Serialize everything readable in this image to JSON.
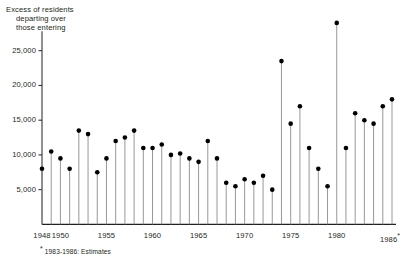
{
  "title": {
    "line1": "Excess of residents",
    "line2": "departing over",
    "line3": "those entering"
  },
  "footnote": {
    "marker": "*",
    "text": "1983-1986: Estimates"
  },
  "axis": {
    "y_ticks": [
      "5,000",
      "10,000",
      "15,000",
      "20,000",
      "25,000"
    ],
    "x_ticks": [
      "1948",
      "1950",
      "1955",
      "1960",
      "1965",
      "1970",
      "1975",
      "1980",
      "1986"
    ]
  },
  "colors": {
    "axis": "#231f20",
    "marker": "#000000",
    "stem": "#8c8c8c",
    "text": "#231f20",
    "background": "#ffffff"
  },
  "chart_data": {
    "type": "line",
    "title": "Excess of residents departing over those entering",
    "subtitle": "",
    "xlabel": "",
    "ylabel": "",
    "xlim": [
      1947.4,
      1986.6
    ],
    "ylim": [
      0,
      30000
    ],
    "grid": false,
    "legend": null,
    "marker_style": "filled-circle-with-stem",
    "x": [
      1948,
      1949,
      1950,
      1951,
      1952,
      1953,
      1954,
      1955,
      1956,
      1957,
      1958,
      1959,
      1960,
      1961,
      1962,
      1963,
      1964,
      1965,
      1966,
      1967,
      1968,
      1969,
      1970,
      1971,
      1972,
      1973,
      1974,
      1975,
      1976,
      1977,
      1978,
      1979,
      1980,
      1981,
      1982,
      1983,
      1984,
      1985,
      1986
    ],
    "values": [
      8000,
      10500,
      9500,
      8000,
      13500,
      13000,
      7500,
      9500,
      12000,
      12500,
      13500,
      11000,
      11000,
      11500,
      10000,
      10200,
      9500,
      9000,
      12000,
      9500,
      6000,
      5500,
      6500,
      6000,
      7000,
      5000,
      23500,
      14500,
      17000,
      11000,
      8000,
      5500,
      29000,
      11000,
      16000,
      15000,
      14500,
      17000,
      18000
    ],
    "y_ticks": [
      5000,
      10000,
      15000,
      20000,
      25000
    ],
    "y_tick_labels": [
      "5,000",
      "10,000",
      "15,000",
      "20,000",
      "25,000"
    ],
    "x_tick_positions": [
      1948,
      1950,
      1955,
      1960,
      1965,
      1970,
      1975,
      1980,
      1986
    ],
    "x_tick_labels": [
      "1948",
      "1950",
      "1955",
      "1960",
      "1965",
      "1970",
      "1975",
      "1980",
      "1986*"
    ],
    "annotations": [
      "* 1983-1986: Estimates"
    ]
  }
}
